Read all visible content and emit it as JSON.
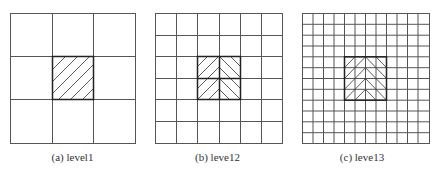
{
  "figure": {
    "panels": [
      {
        "id": "a",
        "caption": "(a) level1",
        "grid_divisions": 3,
        "highlight_cells": [
          [
            1,
            1
          ]
        ],
        "hatch": "diagonal-single"
      },
      {
        "id": "b",
        "caption": "(b) leve12",
        "grid_divisions": 6,
        "highlight_cells": [
          [
            2,
            2
          ],
          [
            2,
            3
          ],
          [
            3,
            2
          ],
          [
            3,
            3
          ]
        ],
        "hatch": "chevron"
      },
      {
        "id": "c",
        "caption": "(c) leve13",
        "grid_divisions": 12,
        "highlight_cells_range": {
          "rows": [
            4,
            7
          ],
          "cols": [
            4,
            7
          ]
        },
        "hatch": "chevron"
      }
    ],
    "colors": {
      "line": "#555555",
      "highlight_border": "#222222",
      "hatch": "#333333"
    }
  }
}
